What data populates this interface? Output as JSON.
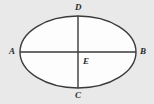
{
  "figure": {
    "name": "ellipse-with-axes",
    "width": 154,
    "height": 104,
    "background_color": "#e9e9e9",
    "shape": {
      "type": "ellipse",
      "center": {
        "x": 78,
        "y": 52,
        "label": "E"
      },
      "semi_major_axis_x": 58,
      "semi_minor_axis_y": 36,
      "fill_color": "#fdfdfd",
      "stroke_color": "#3a3a3a",
      "stroke_width": 1.4
    },
    "axes": [
      {
        "name": "major-axis",
        "orientation": "horizontal",
        "from_label": "A",
        "to_label": "B",
        "x1": 20,
        "y1": 52,
        "x2": 136,
        "y2": 52,
        "stroke_color": "#3a3a3a",
        "stroke_width": 1.4
      },
      {
        "name": "minor-axis",
        "orientation": "vertical",
        "from_label": "D",
        "to_label": "C",
        "x1": 78,
        "y1": 16,
        "x2": 78,
        "y2": 88,
        "stroke_color": "#3a3a3a",
        "stroke_width": 1.4
      }
    ],
    "labels": {
      "left_vertex": "A",
      "right_vertex": "B",
      "top_vertex": "D",
      "bottom_vertex": "C",
      "center": "E"
    },
    "label_color": "#2b2b2b"
  }
}
